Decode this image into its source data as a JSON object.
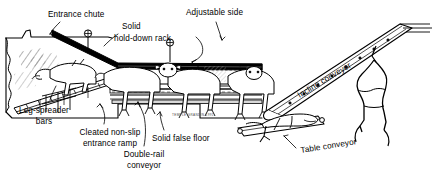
{
  "illustration": {
    "title": "Livestock center-track restrainer system cutaway",
    "credit": "TEMPLE GRANDIN 1991",
    "line_color": "#000000",
    "fill_color": "#ffffff",
    "shade_color": "#9a9a9a"
  },
  "labels": {
    "entrance_chute": "Entrance chute",
    "solid_hold_down_rack_line1": "Solid",
    "solid_hold_down_rack_line2": "hold-down rack",
    "adjustable_side": "Adjustable side",
    "leg_spreader_line1": "Leg-spreader",
    "leg_spreader_line2": "bars",
    "cleated_ramp_line1": "Cleated non-slip",
    "cleated_ramp_line2": "entrance ramp",
    "double_rail_line1": "Double-rail",
    "double_rail_line2": "conveyor",
    "solid_false_floor": "Solid false floor",
    "incline_conveyor": "Incline conveyor",
    "table_conveyor": "Table conveyor"
  }
}
